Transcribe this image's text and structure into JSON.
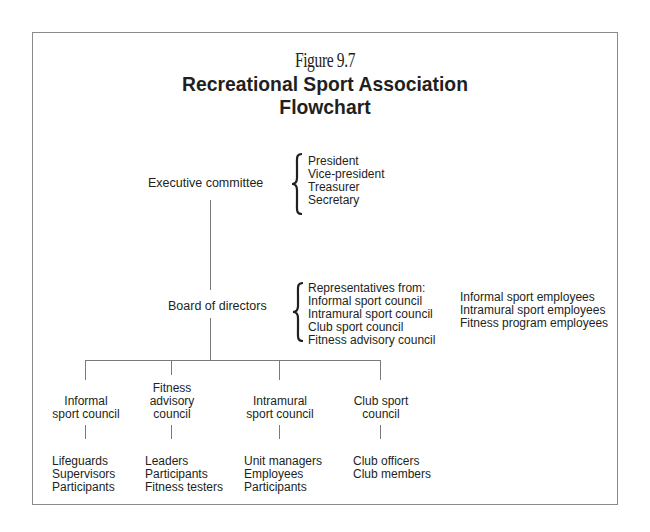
{
  "figure": {
    "number": "Figure 9.7",
    "title_line1": "Recreational Sport Association",
    "title_line2": "Flowchart"
  },
  "executive": {
    "label": "Executive committee",
    "members": [
      "President",
      "Vice-president",
      "Treasurer",
      "Secretary"
    ]
  },
  "board": {
    "label": "Board of directors",
    "representatives": [
      "Representatives from:",
      "Informal sport council",
      "Intramural sport council",
      "Club sport council",
      "Fitness advisory council"
    ],
    "employees": [
      "Informal sport employees",
      "Intramural sport employees",
      "Fitness program employees"
    ]
  },
  "councils": [
    {
      "name_lines": [
        "Informal",
        "sport council"
      ],
      "members": [
        "Lifeguards",
        "Supervisors",
        "Participants"
      ]
    },
    {
      "name_lines": [
        "Fitness",
        "advisory",
        "council"
      ],
      "members": [
        "Leaders",
        "Participants",
        "Fitness testers"
      ]
    },
    {
      "name_lines": [
        "Intramural",
        "sport council"
      ],
      "members": [
        "Unit managers",
        "Employees",
        "Participants"
      ]
    },
    {
      "name_lines": [
        "Club sport",
        "council"
      ],
      "members": [
        "Club officers",
        "Club members"
      ]
    }
  ]
}
